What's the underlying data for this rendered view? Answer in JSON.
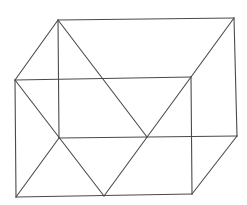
{
  "diagram": {
    "type": "wireframe-box",
    "stroke_color": "#4a4a4a",
    "background": "#ffffff",
    "vertices": {
      "front_top_left": [
        15,
        80
      ],
      "front_top_right": [
        191,
        77
      ],
      "front_bottom_right": [
        192,
        194
      ],
      "front_bottom_left": [
        16,
        197
      ],
      "back_top_left": [
        58,
        20
      ],
      "back_top_right": [
        234,
        18
      ],
      "back_bottom_right": [
        237,
        136
      ],
      "back_bottom_left": [
        59,
        138
      ],
      "bottom_mid": [
        104,
        196
      ],
      "back_mid": [
        147,
        137
      ]
    },
    "edges": [
      {
        "name": "front-top-edge",
        "from": [
          15,
          80
        ],
        "to": [
          191,
          77
        ]
      },
      {
        "name": "front-right-edge",
        "from": [
          191,
          77
        ],
        "to": [
          192,
          194
        ]
      },
      {
        "name": "front-bottom-edge",
        "from": [
          192,
          194
        ],
        "to": [
          16,
          197
        ]
      },
      {
        "name": "front-left-edge",
        "from": [
          16,
          197
        ],
        "to": [
          15,
          80
        ]
      },
      {
        "name": "back-top-edge",
        "from": [
          58,
          20
        ],
        "to": [
          234,
          18
        ]
      },
      {
        "name": "back-right-edge",
        "from": [
          234,
          18
        ],
        "to": [
          237,
          136
        ]
      },
      {
        "name": "back-bottom-edge",
        "from": [
          237,
          136
        ],
        "to": [
          59,
          138
        ]
      },
      {
        "name": "back-left-edge",
        "from": [
          59,
          138
        ],
        "to": [
          58,
          20
        ]
      },
      {
        "name": "top-left-connector",
        "from": [
          15,
          80
        ],
        "to": [
          58,
          20
        ]
      },
      {
        "name": "top-right-connector",
        "from": [
          191,
          77
        ],
        "to": [
          234,
          18
        ]
      },
      {
        "name": "bottom-right-connector",
        "from": [
          192,
          194
        ],
        "to": [
          237,
          136
        ]
      },
      {
        "name": "bottom-left-connector",
        "from": [
          16,
          197
        ],
        "to": [
          59,
          138
        ]
      },
      {
        "name": "diagonal-back-top-left-to-mid",
        "from": [
          58,
          20
        ],
        "to": [
          147,
          137
        ]
      },
      {
        "name": "diagonal-front-top-right-to-bottom-mid",
        "from": [
          191,
          77
        ],
        "to": [
          104,
          196
        ]
      },
      {
        "name": "diagonal-front-top-left-to-bottom-mid",
        "from": [
          15,
          80
        ],
        "to": [
          104,
          196
        ]
      }
    ]
  }
}
